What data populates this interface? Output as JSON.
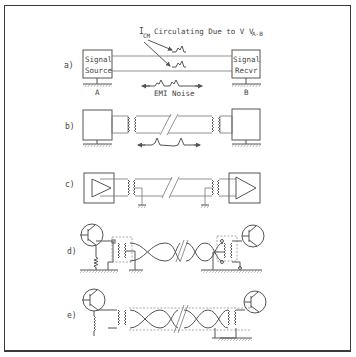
{
  "figure": {
    "panels": [
      {
        "id": "a",
        "label": "a)",
        "description": "Signal source to signal receiver, common-mode current and EMI noise"
      },
      {
        "id": "b",
        "label": "b)",
        "description": "Transformer-isolated link with broken cable and noise"
      },
      {
        "id": "c",
        "label": "c)",
        "description": "Amplifier driver/receiver with transformer coupling and grounded center taps"
      },
      {
        "id": "d",
        "label": "d)",
        "description": "Transistor stages with twisted pair and shielded transformers, grounded"
      },
      {
        "id": "e",
        "label": "e)",
        "description": "Transistor stages with shielded twisted pair, ground at receiver"
      }
    ],
    "panel_a": {
      "source_box": "Signal\nSource",
      "source_line1": "Signal",
      "source_line2": "Source",
      "receiver_line1": "Signal",
      "receiver_line2": "Recvr",
      "ground_a": "A",
      "ground_b": "B",
      "icm_main": "I",
      "icm_sub": "CM",
      "circulating_text": " Circulating Due to V",
      "v_sub": "A-B",
      "emi_label": "EMI Noise"
    }
  },
  "colors": {
    "line": "#555555",
    "frame": "#3a3a3a",
    "text": "#444444",
    "background": "#ffffff"
  }
}
